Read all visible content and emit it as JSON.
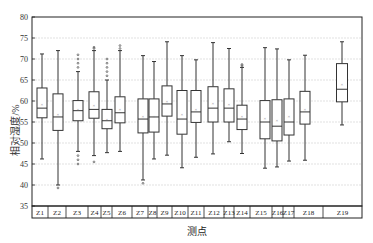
{
  "chart_data": {
    "type": "box",
    "title": "",
    "xlabel": "测点",
    "ylabel": "相对湿度/%",
    "ylim": [
      35,
      80
    ],
    "yticks": [
      35,
      40,
      45,
      50,
      55,
      60,
      65,
      70,
      75,
      80
    ],
    "grid": true,
    "legend": null,
    "categories": [
      "Z1",
      "Z2",
      "Z3",
      "Z4",
      "Z5",
      "Z6",
      "Z7",
      "Z8",
      "Z9",
      "Z10",
      "Z11",
      "Z12",
      "Z13",
      "Z14",
      "Z15",
      "Z16",
      "Z17",
      "Z18",
      "Z19"
    ],
    "boxes": [
      {
        "name": "Z1",
        "min": 46.2,
        "q1": 56.0,
        "median": 58.3,
        "q3": 63.1,
        "max": 71.2,
        "mean": 59.3,
        "outliers": []
      },
      {
        "name": "Z2",
        "min": 40.0,
        "q1": 53.0,
        "median": 56.2,
        "q3": 61.7,
        "max": 72.0,
        "mean": 57.0,
        "outliers": [
          39.3
        ]
      },
      {
        "name": "Z3",
        "min": 48.0,
        "q1": 55.3,
        "median": 57.7,
        "q3": 60.1,
        "max": 67.0,
        "mean": 58.0,
        "outliers": [
          68,
          69,
          70,
          71,
          45,
          46,
          47
        ]
      },
      {
        "name": "Z4",
        "min": 47.0,
        "q1": 55.9,
        "median": 58.0,
        "q3": 62.2,
        "max": 72.0,
        "mean": 59.0,
        "outliers": [
          72.5,
          72.8,
          45.5
        ]
      },
      {
        "name": "Z5",
        "min": 47.7,
        "q1": 53.4,
        "median": 55.3,
        "q3": 58.0,
        "max": 65.0,
        "mean": 55.8,
        "outliers": [
          66,
          67,
          68,
          69,
          70
        ]
      },
      {
        "name": "Z6",
        "min": 48.0,
        "q1": 54.8,
        "median": 57.2,
        "q3": 61.0,
        "max": 72.0,
        "mean": 58.0,
        "outliers": [
          72.5,
          73.2
        ]
      },
      {
        "name": "Z7",
        "min": 41.2,
        "q1": 52.4,
        "median": 55.7,
        "q3": 60.5,
        "max": 70.8,
        "mean": 56.4,
        "outliers": [
          40.4
        ]
      },
      {
        "name": "Z8",
        "min": 46.2,
        "q1": 52.6,
        "median": 56.2,
        "q3": 60.5,
        "max": 69.4,
        "mean": 56.5,
        "outliers": []
      },
      {
        "name": "Z9",
        "min": 47.1,
        "q1": 56.4,
        "median": 59.3,
        "q3": 63.6,
        "max": 74.1,
        "mean": 60.0,
        "outliers": []
      },
      {
        "name": "Z10",
        "min": 44.1,
        "q1": 52.1,
        "median": 55.7,
        "q3": 62.5,
        "max": 70.8,
        "mean": 57.0,
        "outliers": []
      },
      {
        "name": "Z11",
        "min": 46.6,
        "q1": 54.9,
        "median": 57.4,
        "q3": 62.5,
        "max": 69.8,
        "mean": 58.0,
        "outliers": []
      },
      {
        "name": "Z12",
        "min": 47.4,
        "q1": 55.0,
        "median": 58.3,
        "q3": 63.4,
        "max": 73.9,
        "mean": 59.5,
        "outliers": []
      },
      {
        "name": "Z13",
        "min": 50.3,
        "q1": 55.0,
        "median": 58.3,
        "q3": 62.9,
        "max": 72.5,
        "mean": 59.2,
        "outliers": []
      },
      {
        "name": "Z14",
        "min": 47.5,
        "q1": 53.2,
        "median": 55.7,
        "q3": 59.0,
        "max": 68.0,
        "mean": 56.5,
        "outliers": [
          68.4,
          68.7
        ]
      },
      {
        "name": "Z15",
        "min": 44.0,
        "q1": 51.0,
        "median": 55.0,
        "q3": 60.1,
        "max": 72.7,
        "mean": 56.0,
        "outliers": []
      },
      {
        "name": "Z16",
        "min": 44.3,
        "q1": 50.5,
        "median": 54.0,
        "q3": 60.3,
        "max": 72.4,
        "mean": 55.5,
        "outliers": []
      },
      {
        "name": "Z17",
        "min": 45.7,
        "q1": 51.9,
        "median": 55.0,
        "q3": 60.5,
        "max": 69.8,
        "mean": 56.5,
        "outliers": []
      },
      {
        "name": "Z18",
        "min": 45.9,
        "q1": 54.5,
        "median": 57.4,
        "q3": 62.3,
        "max": 70.9,
        "mean": 58.0,
        "outliers": []
      },
      {
        "name": "Z19",
        "min": 54.3,
        "q1": 59.8,
        "median": 62.8,
        "q3": 68.9,
        "max": 74.1,
        "mean": 64.0,
        "outliers": []
      }
    ],
    "category_cell_bounds": [
      [
        32,
        48
      ],
      [
        48,
        66
      ],
      [
        66,
        88
      ],
      [
        88,
        101
      ],
      [
        101,
        112
      ],
      [
        112,
        132
      ],
      [
        132,
        148
      ],
      [
        148,
        157
      ],
      [
        157,
        172
      ],
      [
        172,
        188
      ],
      [
        188,
        204
      ],
      [
        204,
        224
      ],
      [
        224,
        234
      ],
      [
        234,
        250
      ],
      [
        250,
        272
      ],
      [
        272,
        283
      ],
      [
        283,
        294
      ],
      [
        294,
        323
      ],
      [
        323,
        362
      ]
    ],
    "box_x_centers": [
      42,
      58,
      78,
      94,
      107,
      120,
      143,
      154,
      167,
      182,
      196,
      213,
      229,
      242,
      265,
      277,
      289,
      305,
      342
    ]
  },
  "colors": {
    "box_stroke": "#333333",
    "grid": "#d9d9d9",
    "axis": "#222222",
    "mean_marker": "#888888"
  }
}
